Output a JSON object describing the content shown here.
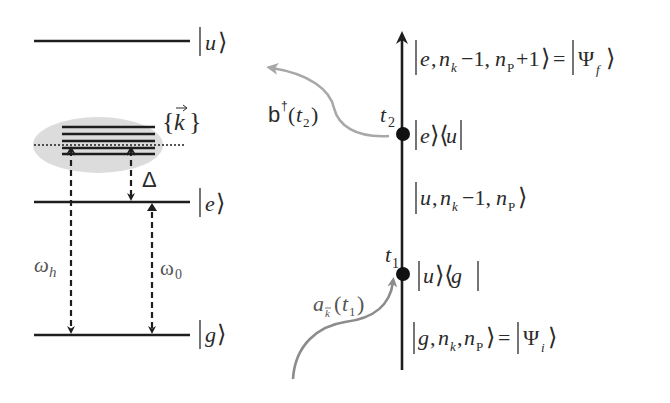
{
  "colors": {
    "line": "#1e1e1e",
    "band_ellipse": "#dcdcdc",
    "photon_arrow": "#a8a8a8",
    "absorb_arrow": "#8c8c8c",
    "text": "#2a2a2a"
  },
  "energy_diagram": {
    "levels": {
      "u": {
        "label_state": "u"
      },
      "e": {
        "label_state": "e"
      },
      "g": {
        "label_state": "g"
      }
    },
    "continuum_label": "k",
    "detuning_label": "Δ",
    "omega_h": {
      "symbol": "ω",
      "sub": "h"
    },
    "omega_0": {
      "symbol": "ω",
      "sub": "0"
    }
  },
  "timeline": {
    "vertices": [
      {
        "time_symbol": "t",
        "time_sub": "2",
        "operator": "|e⟩⟨u|",
        "op_ket": "e",
        "op_bra": "u"
      },
      {
        "time_symbol": "t",
        "time_sub": "1",
        "operator": "|u⟩⟨g|",
        "op_ket": "u",
        "op_bra": "g"
      }
    ],
    "states": {
      "final": {
        "text": "|e, n_k −1, n_P +1⟩ = |Ψ_f⟩",
        "a": "e",
        "nk": "n",
        "nk_sub": "k",
        "m1": "−1,",
        "np": "n",
        "np_sub": "P",
        "p1": "+1",
        "psi": "Ψ",
        "psi_sub": "f"
      },
      "intermediate": {
        "text": "|u, n_k −1, n_P⟩",
        "a": "u",
        "nk": "n",
        "nk_sub": "k",
        "m1": "−1,",
        "np": "n",
        "np_sub": "P"
      },
      "initial": {
        "text": "|g, n_k, n_P⟩ = |Ψ_i⟩",
        "a": "g",
        "nk": "n",
        "nk_sub": "k",
        "np": "n",
        "np_sub": "P",
        "psi": "Ψ",
        "psi_sub": "i"
      }
    },
    "emission_operator": {
      "base": "b",
      "dagger": "†",
      "arg": "t",
      "arg_sub": "2"
    },
    "absorption_operator": {
      "base": "a",
      "sub": "k",
      "arg": "t",
      "arg_sub": "1"
    }
  }
}
